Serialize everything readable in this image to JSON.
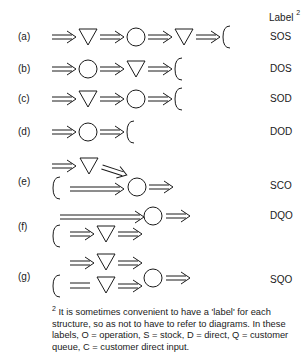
{
  "header": {
    "label_title": "Label",
    "footnote_marker": "2"
  },
  "rows": [
    {
      "id": "(a)",
      "code": "SOS",
      "sequence": [
        "arrow",
        "stock",
        "arrow",
        "operation",
        "arrow",
        "stock",
        "arrow",
        "customer"
      ]
    },
    {
      "id": "(b)",
      "code": "DOS",
      "sequence": [
        "arrow",
        "operation",
        "arrow",
        "stock",
        "arrow",
        "customer"
      ]
    },
    {
      "id": "(c)",
      "code": "SOD",
      "sequence": [
        "arrow",
        "stock",
        "arrow",
        "operation",
        "arrow",
        "customer"
      ]
    },
    {
      "id": "(d)",
      "code": "DOD",
      "sequence": [
        "arrow",
        "operation",
        "arrow",
        "customer"
      ]
    },
    {
      "id": "(e)",
      "code": "SCO",
      "sequence": [
        "arrow",
        "stock",
        "arrow",
        "operation",
        "arrow",
        "customer-input",
        "long-arrow"
      ]
    },
    {
      "id": "(f)",
      "code": "DQO",
      "sequence": [
        "long-arrow",
        "operation",
        "arrow",
        "customer-queue",
        "arrow",
        "stock",
        "arrow"
      ]
    },
    {
      "id": "(g)",
      "code": "SQO",
      "sequence": [
        "arrow",
        "stock",
        "arrow",
        "customer-queue",
        "equals",
        "stock",
        "arrow",
        "operation",
        "arrow"
      ]
    }
  ],
  "legend": {
    "symbols": [
      {
        "name": "double-arrow",
        "glyph": "⇒"
      },
      {
        "name": "stock",
        "glyph": "▽"
      },
      {
        "name": "operation",
        "glyph": "○"
      },
      {
        "name": "customer",
        "glyph": "C"
      }
    ]
  },
  "footnote": {
    "marker": "2",
    "text": "It is sometimes convenient to have a 'label' for each structure, so as not to have to refer to diagrams. In these labels, O = operation, S = stock, D = direct, Q = customer queue, C = customer direct input."
  },
  "colors": {
    "ink": "#1a1a1a",
    "background": "#ffffff"
  }
}
